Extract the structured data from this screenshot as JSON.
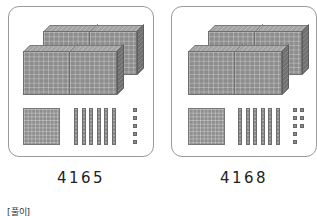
{
  "problems": [
    {
      "number": "4165",
      "blocks": {
        "thousands": 4,
        "hundreds": 1,
        "tens": 6,
        "ones": 5
      }
    },
    {
      "number": "4168",
      "blocks": {
        "thousands": 4,
        "hundreds": 1,
        "tens": 6,
        "ones": 8
      }
    }
  ],
  "solution_label": "[풀이]",
  "colors": {
    "block": "#8d8d8d",
    "border": "#9a9a9a",
    "text": "#222222"
  }
}
